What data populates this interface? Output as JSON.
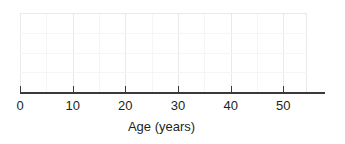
{
  "chart_data": {
    "type": "line",
    "title": "",
    "subtitle": "",
    "xlabel": "Age (years)",
    "ylabel": "",
    "xlim": [
      0,
      54.5
    ],
    "ylim": [
      0,
      3
    ],
    "xticks": [
      0,
      10,
      20,
      30,
      40,
      50
    ],
    "xtick_labels": [
      "0",
      "10",
      "20",
      "30",
      "40",
      "50"
    ],
    "x_minor_tick_step": 5,
    "yticks": [],
    "ytick_labels": [],
    "grid": true,
    "grid_major_color": "#e9e9ea",
    "grid_minor_color": "#f5f5f6",
    "legend": null,
    "legend_position": "none",
    "annotations": [],
    "series": [],
    "x": [],
    "values": [],
    "note": "Empty plot frame: faint grid with no plotted data series."
  },
  "axis": {
    "line_color": "#3a3a3a",
    "tick_color": "#3a3a3a",
    "label_color": "#231f20",
    "title": "Age (years)",
    "tick_labels": [
      "0",
      "10",
      "20",
      "30",
      "40",
      "50"
    ]
  },
  "grid": {
    "major_vertical_values": [
      0,
      10,
      20,
      30,
      40,
      50
    ],
    "minor_vertical_values": [
      5,
      15,
      25,
      35,
      45
    ],
    "horizontal_count": 4
  },
  "colors": {
    "background": "#ffffff",
    "axis": "#3a3a3a",
    "text": "#231f20",
    "grid_major": "#e9e9ea",
    "grid_minor": "#f5f5f6"
  }
}
